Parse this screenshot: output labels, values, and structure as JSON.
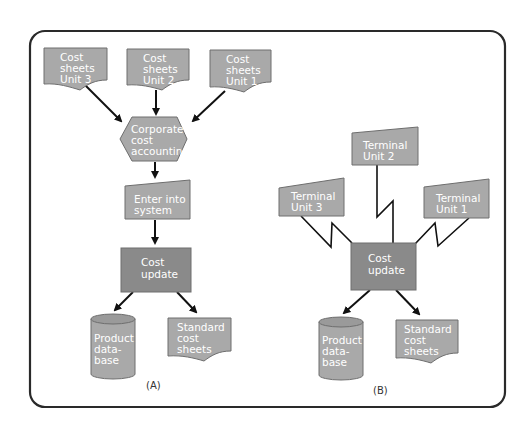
{
  "colors": {
    "frame": "#2a2a2a",
    "light_gray": "#a9a9a9",
    "dark_gray": "#8a8a8a",
    "stroke": "#6e6e6e",
    "text": "#ffffff",
    "arrow": "#111111"
  },
  "panel_a": {
    "caption": "(A)",
    "documents": [
      {
        "line1": "Cost",
        "line2": "sheets",
        "line3": "Unit 3"
      },
      {
        "line1": "Cost",
        "line2": "sheets",
        "line3": "Unit 2"
      },
      {
        "line1": "Cost",
        "line2": "sheets",
        "line3": "Unit 1"
      }
    ],
    "process": {
      "line1": "Corporate",
      "line2": "cost",
      "line3": "accounting"
    },
    "manual_input": {
      "line1": "Enter into",
      "line2": "system"
    },
    "update": {
      "line1": "Cost",
      "line2": "update"
    },
    "database": {
      "line1": "Product",
      "line2": "data-",
      "line3": "base"
    },
    "output_doc": {
      "line1": "Standard",
      "line2": "cost",
      "line3": "sheets"
    }
  },
  "panel_b": {
    "caption": "(B)",
    "terminals": [
      {
        "line1": "Terminal",
        "line2": "Unit 2"
      },
      {
        "line1": "Terminal",
        "line2": "Unit 3"
      },
      {
        "line1": "Terminal",
        "line2": "Unit 1"
      }
    ],
    "update": {
      "line1": "Cost",
      "line2": "update"
    },
    "database": {
      "line1": "Product",
      "line2": "data-",
      "line3": "base"
    },
    "output_doc": {
      "line1": "Standard",
      "line2": "cost",
      "line3": "sheets"
    }
  }
}
